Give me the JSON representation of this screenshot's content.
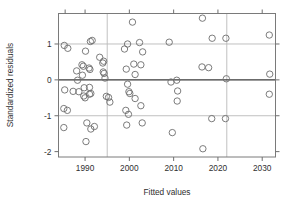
{
  "figure": {
    "background_color": "#ffffff",
    "frame_color": "#7a7a7a",
    "grid_color": "#b9b9b9",
    "zero_line_color": "#3a3a3a",
    "marker_color": "#6d6d6d"
  },
  "labels": {
    "x_axis_title": "Fitted values",
    "y_axis_title": "Standardized residuals"
  },
  "chart_data": {
    "type": "scatter",
    "title": "",
    "xlabel": "Fitted values",
    "ylabel": "Standardized residuals",
    "xlim": [
      1984.0,
      2033.0
    ],
    "ylim": [
      -2.15,
      1.85
    ],
    "xticks": [
      1990,
      2000,
      2010,
      2020,
      2030
    ],
    "xticklabels": [
      "1990",
      "2000",
      "2010",
      "2020",
      "2030"
    ],
    "yticks": [
      1,
      0,
      -1,
      -2
    ],
    "yticklabels": [
      "1",
      "0",
      "-1",
      "-2"
    ],
    "grid": true,
    "hlines": [
      1,
      -1
    ],
    "zero_line": 0,
    "vlines": [
      1995,
      2022
    ],
    "legend": null,
    "marker": "open-circle",
    "marker_size": 3.2,
    "points": [
      {
        "x": 1985.3,
        "y": 0.96
      },
      {
        "x": 1986.1,
        "y": 0.88
      },
      {
        "x": 1985.4,
        "y": -0.28
      },
      {
        "x": 1985.2,
        "y": -0.8
      },
      {
        "x": 1986.0,
        "y": -0.85
      },
      {
        "x": 1985.2,
        "y": -1.33
      },
      {
        "x": 1987.3,
        "y": -0.32
      },
      {
        "x": 1988.1,
        "y": 0.25
      },
      {
        "x": 1988.3,
        "y": -0.01
      },
      {
        "x": 1988.6,
        "y": -0.33
      },
      {
        "x": 1989.3,
        "y": 0.42
      },
      {
        "x": 1989.6,
        "y": 0.38
      },
      {
        "x": 1989.4,
        "y": 0.13
      },
      {
        "x": 1989.8,
        "y": -0.22
      },
      {
        "x": 1989.7,
        "y": -0.45
      },
      {
        "x": 1990.0,
        "y": -0.5
      },
      {
        "x": 1990.1,
        "y": 0.8
      },
      {
        "x": 1990.4,
        "y": -1.2
      },
      {
        "x": 1990.2,
        "y": -1.72
      },
      {
        "x": 1990.9,
        "y": 0.33
      },
      {
        "x": 1991.1,
        "y": 0.29
      },
      {
        "x": 1991.0,
        "y": -0.21
      },
      {
        "x": 1991.3,
        "y": -0.38
      },
      {
        "x": 1991.0,
        "y": -0.4
      },
      {
        "x": 1991.2,
        "y": 1.07
      },
      {
        "x": 1991.6,
        "y": 1.1
      },
      {
        "x": 1991.3,
        "y": -1.37
      },
      {
        "x": 1992.1,
        "y": -1.3
      },
      {
        "x": 1993.3,
        "y": 0.63
      },
      {
        "x": 1994.2,
        "y": 0.52
      },
      {
        "x": 1994.0,
        "y": 0.47
      },
      {
        "x": 1994.1,
        "y": 0.22
      },
      {
        "x": 1994.3,
        "y": 0.18
      },
      {
        "x": 1994.5,
        "y": 0.05
      },
      {
        "x": 1994.8,
        "y": -0.46
      },
      {
        "x": 1995.3,
        "y": -0.49
      },
      {
        "x": 1995.6,
        "y": -0.62
      },
      {
        "x": 1998.9,
        "y": 0.86
      },
      {
        "x": 1999.6,
        "y": 1.0
      },
      {
        "x": 1999.3,
        "y": 0.3
      },
      {
        "x": 1999.6,
        "y": -0.12
      },
      {
        "x": 1999.9,
        "y": -0.33
      },
      {
        "x": 2000.1,
        "y": -0.38
      },
      {
        "x": 1999.2,
        "y": -0.85
      },
      {
        "x": 1999.8,
        "y": -0.96
      },
      {
        "x": 1999.4,
        "y": -1.26
      },
      {
        "x": 2000.7,
        "y": 1.61
      },
      {
        "x": 2001.0,
        "y": 0.44
      },
      {
        "x": 2001.3,
        "y": 0.15
      },
      {
        "x": 2001.3,
        "y": -0.52
      },
      {
        "x": 2002.3,
        "y": 1.04
      },
      {
        "x": 2002.6,
        "y": 0.42
      },
      {
        "x": 2002.6,
        "y": -0.72
      },
      {
        "x": 2003.0,
        "y": 0.78
      },
      {
        "x": 2002.9,
        "y": -1.2
      },
      {
        "x": 2009.0,
        "y": 1.05
      },
      {
        "x": 2009.4,
        "y": -0.06
      },
      {
        "x": 2009.7,
        "y": -1.47
      },
      {
        "x": 2010.7,
        "y": -0.01
      },
      {
        "x": 2010.9,
        "y": -0.31
      },
      {
        "x": 2010.8,
        "y": -0.59
      },
      {
        "x": 2016.5,
        "y": 1.72
      },
      {
        "x": 2016.4,
        "y": 0.36
      },
      {
        "x": 2016.6,
        "y": -1.92
      },
      {
        "x": 2017.9,
        "y": 0.34
      },
      {
        "x": 2018.7,
        "y": 1.16
      },
      {
        "x": 2018.6,
        "y": -1.08
      },
      {
        "x": 2021.8,
        "y": 1.16
      },
      {
        "x": 2021.9,
        "y": 0.03
      },
      {
        "x": 2021.7,
        "y": -1.08
      },
      {
        "x": 2031.6,
        "y": 1.25
      },
      {
        "x": 2031.7,
        "y": 0.16
      },
      {
        "x": 2031.6,
        "y": -0.4
      }
    ]
  }
}
